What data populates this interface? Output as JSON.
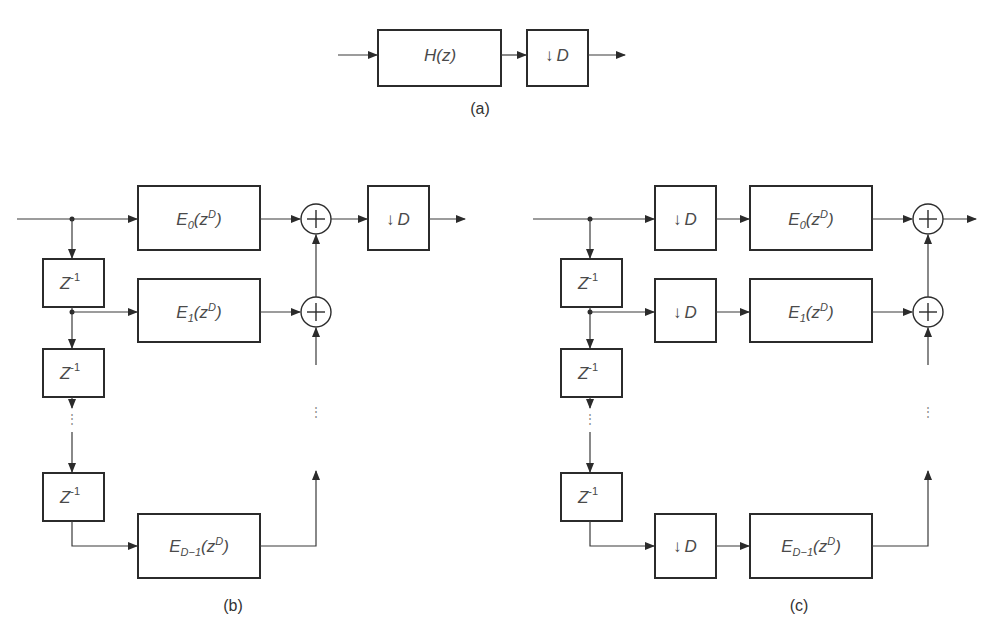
{
  "figure": {
    "panels": [
      {
        "id": "a",
        "caption": "(a)",
        "blocks": [
          {
            "type": "filter",
            "label": "H(z)"
          },
          {
            "type": "downsampler",
            "arrow": "↓",
            "label": "D"
          }
        ]
      },
      {
        "id": "b",
        "caption": "(b)",
        "delay_label": "Z",
        "delay_exp": "-1",
        "polyphase": [
          {
            "E": "E",
            "sub": "0",
            "arg": "(z",
            "exp": "D",
            "close": ")"
          },
          {
            "E": "E",
            "sub": "1",
            "arg": "(z",
            "exp": "D",
            "close": ")"
          },
          {
            "E": "E",
            "sub": "D−1",
            "arg": "(z",
            "exp": "D",
            "close": ")"
          }
        ],
        "downsampler": {
          "arrow": "↓",
          "label": "D"
        },
        "adder_symbol": "+",
        "ellipsis": "⋮"
      },
      {
        "id": "c",
        "caption": "(c)",
        "delay_label": "Z",
        "delay_exp": "-1",
        "polyphase": [
          {
            "E": "E",
            "sub": "0",
            "arg": "(z",
            "exp": "D",
            "close": ")"
          },
          {
            "E": "E",
            "sub": "1",
            "arg": "(z",
            "exp": "D",
            "close": ")"
          },
          {
            "E": "E",
            "sub": "D−1",
            "arg": "(z",
            "exp": "D",
            "close": ")"
          }
        ],
        "downsampler": {
          "arrow": "↓",
          "label": "D"
        },
        "adder_symbol": "+",
        "ellipsis": "⋮"
      }
    ]
  }
}
